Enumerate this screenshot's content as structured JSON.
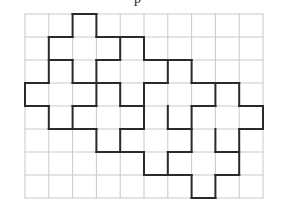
{
  "diagram": {
    "title_fragment": "p",
    "grid": {
      "origin_x": 25,
      "origin_y": 14,
      "cell_w": 23.8,
      "cell_h": 23.0,
      "cols": 10,
      "rows": 8,
      "grid_color": "#c9c9c9",
      "outline_color": "#2a2a2a"
    },
    "horizontal_segments": [
      [
        0,
        2,
        3
      ],
      [
        1,
        1,
        2
      ],
      [
        1,
        3,
        5
      ],
      [
        2,
        1,
        2
      ],
      [
        2,
        3,
        4
      ],
      [
        2,
        5,
        7
      ],
      [
        3,
        0,
        1
      ],
      [
        3,
        2,
        4
      ],
      [
        3,
        5,
        6
      ],
      [
        3,
        7,
        9
      ],
      [
        4,
        0,
        1
      ],
      [
        4,
        2,
        3
      ],
      [
        4,
        4,
        5
      ],
      [
        4,
        7,
        8
      ],
      [
        4,
        9,
        10
      ],
      [
        5,
        1,
        3
      ],
      [
        5,
        4,
        5
      ],
      [
        5,
        6,
        7
      ],
      [
        5,
        9,
        10
      ],
      [
        6,
        3,
        5
      ],
      [
        6,
        6,
        7
      ],
      [
        6,
        8,
        9
      ],
      [
        7,
        5,
        7
      ],
      [
        7,
        8,
        9
      ],
      [
        8,
        7,
        8
      ]
    ],
    "vertical_segments": [
      [
        0,
        3,
        4
      ],
      [
        1,
        1,
        3
      ],
      [
        1,
        4,
        5
      ],
      [
        2,
        0,
        1
      ],
      [
        2,
        2,
        3
      ],
      [
        2,
        4,
        5
      ],
      [
        3,
        0,
        1
      ],
      [
        3,
        2,
        4
      ],
      [
        3,
        5,
        6
      ],
      [
        4,
        1,
        2
      ],
      [
        4,
        3,
        4
      ],
      [
        4,
        5,
        6
      ],
      [
        5,
        1,
        2
      ],
      [
        5,
        3,
        5
      ],
      [
        5,
        6,
        7
      ],
      [
        6,
        2,
        3
      ],
      [
        6,
        4,
        5
      ],
      [
        6,
        6,
        7
      ],
      [
        7,
        2,
        3
      ],
      [
        7,
        4,
        6
      ],
      [
        7,
        7,
        8
      ],
      [
        8,
        3,
        4
      ],
      [
        8,
        5,
        6
      ],
      [
        8,
        7,
        8
      ],
      [
        9,
        3,
        4
      ],
      [
        9,
        5,
        7
      ],
      [
        10,
        4,
        5
      ]
    ]
  }
}
